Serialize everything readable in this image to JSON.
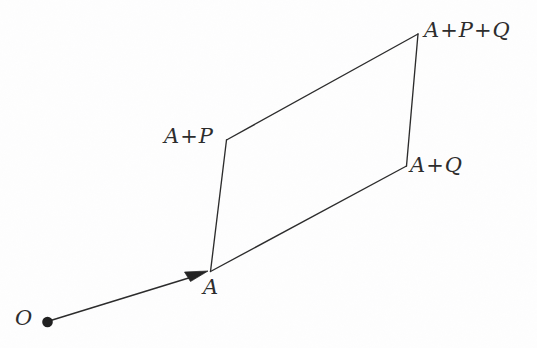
{
  "figure": {
    "type": "geometric-diagram",
    "background_color": "#fefefe",
    "ink_color": "#2b2b2b",
    "width": 537,
    "height": 348
  },
  "labels": {
    "origin": "O",
    "base_point": "A",
    "a_plus_p": {
      "base": "A",
      "op1": "+",
      "term1": "P"
    },
    "a_plus_q": {
      "base": "A",
      "op1": "+",
      "term1": "Q"
    },
    "a_plus_p_plus_q": {
      "base": "A",
      "op1": "+",
      "term1": "P",
      "op2": "+",
      "term2": "Q"
    }
  },
  "geometry": {
    "points": {
      "O": {
        "x": 47,
        "y": 322
      },
      "A": {
        "x": 210,
        "y": 272
      },
      "A_plus_P": {
        "x": 226,
        "y": 140
      },
      "A_plus_Q": {
        "x": 406,
        "y": 166
      },
      "A_plus_P_plus_Q": {
        "x": 418,
        "y": 34
      }
    },
    "edges": [
      {
        "name": "A-to-A+P",
        "from": "A",
        "to": "A_plus_P"
      },
      {
        "name": "A+P-to-A+P+Q",
        "from": "A_plus_P",
        "to": "A_plus_P_plus_Q"
      },
      {
        "name": "A+P+Q-to-A+Q",
        "from": "A_plus_P_plus_Q",
        "to": "A_plus_Q"
      },
      {
        "name": "A+Q-to-A",
        "from": "A_plus_Q",
        "to": "A"
      }
    ],
    "vector": {
      "name": "O-to-A",
      "from": "O",
      "to": "A",
      "has_arrowhead": true
    },
    "origin_dot_radius": 5.2,
    "line_width": 1.3
  }
}
